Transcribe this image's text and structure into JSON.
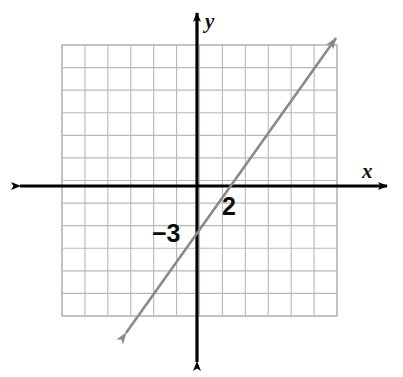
{
  "figure": {
    "kind": "coordinate-plane-line-graph",
    "width": 403,
    "height": 377,
    "background_color": "#ffffff"
  },
  "axes": {
    "x_axis_label": "x",
    "y_axis_label": "y",
    "axis_color": "#000000",
    "origin_px": {
      "x": 197,
      "y": 186
    },
    "x_axis_start_px": {
      "x": 20,
      "y": 186
    },
    "x_axis_end_px": {
      "x": 387,
      "y": 186
    },
    "y_axis_start_px": {
      "x": 197,
      "y": 362
    },
    "y_axis_end_px": {
      "x": 197,
      "y": 13
    },
    "x_label_pos_px": {
      "x": 362,
      "y": 178
    },
    "y_label_pos_px": {
      "x": 205,
      "y": 28
    },
    "arrowheads": [
      "left",
      "right",
      "up",
      "down"
    ]
  },
  "grid": {
    "color": "#b8b8b8",
    "left_px": 62,
    "top_px": 45,
    "right_px": 337,
    "bottom_px": 316,
    "columns": 12,
    "rows": 12,
    "cell_width_px": 22.92,
    "cell_height_px": 22.58,
    "x_range": [
      -6,
      6
    ],
    "y_range": [
      -6,
      6
    ]
  },
  "labels": [
    {
      "id": "x-intercept-label",
      "text": "2",
      "pos_px": {
        "x": 222,
        "y": 215
      },
      "describes": "x-intercept"
    },
    {
      "id": "y-intercept-label",
      "text": "−3",
      "pos_px": {
        "x": 152,
        "y": 242
      },
      "describes": "y-intercept"
    }
  ],
  "chart_data": {
    "type": "line",
    "title": "",
    "xlabel": "x",
    "ylabel": "y",
    "xlim": [
      -6,
      6
    ],
    "ylim": [
      -6,
      6
    ],
    "grid": true,
    "legend": "none",
    "series": [
      {
        "name": "line",
        "color": "#8a8a8a",
        "equation": "y = 1.5x - 3",
        "slope": 1.5,
        "y_intercept": -3,
        "x_intercept": 2,
        "x": [
          -2.9,
          -2,
          -1,
          0,
          1,
          2,
          3,
          4,
          5,
          6.1
        ],
        "y": [
          -7.35,
          -6,
          -4.5,
          -3,
          -1.5,
          0,
          1.5,
          3,
          4.5,
          6.15
        ],
        "draw_from_px": {
          "x": 126,
          "y": 333
        },
        "draw_to_px": {
          "x": 336,
          "y": 38
        },
        "arrow_start": true,
        "arrow_end": true
      }
    ],
    "annotations": [
      {
        "text": "2",
        "x": 2,
        "y": -0.6,
        "note": "x-intercept label"
      },
      {
        "text": "−3",
        "x": -1.6,
        "y": -2.05,
        "note": "y-intercept label"
      }
    ]
  },
  "colors": {
    "grid_line": "#b8b8b8",
    "axis": "#000000",
    "function_line": "#8a8a8a",
    "text": "#111111",
    "background": "#ffffff"
  }
}
